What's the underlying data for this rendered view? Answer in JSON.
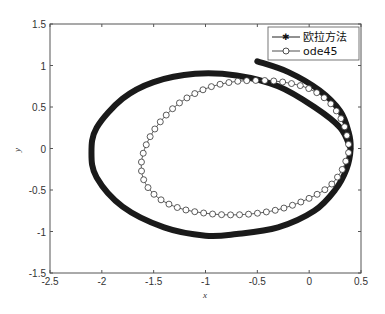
{
  "chart_data": {
    "type": "line",
    "title": "",
    "xlabel": "x",
    "ylabel": "y",
    "xlim": [
      -2.5,
      0.5
    ],
    "ylim": [
      -1.5,
      1.5
    ],
    "xticks": [
      "-2.5",
      "-2",
      "-1.5",
      "-1",
      "-0.5",
      "0",
      "0.5"
    ],
    "yticks": [
      "1.5",
      "1",
      "0.5",
      "0",
      "-0.5",
      "-1",
      "-1.5"
    ],
    "grid": false,
    "legend_position": "upper right",
    "legend": [
      "欧拉方法",
      "ode45"
    ],
    "series": [
      {
        "name": "欧拉方法",
        "marker": "*",
        "style": "thick dense starred line",
        "x": [
          -0.5,
          -0.2,
          0.1,
          0.3,
          0.38,
          0.4,
          0.36,
          0.25,
          0.05,
          -0.3,
          -0.7,
          -1.0,
          -1.4,
          -1.8,
          -2.05,
          -2.1,
          -2.05,
          -1.8,
          -1.5,
          -1.1,
          -0.7,
          -0.3,
          0.05,
          0.3,
          0.4
        ],
        "y": [
          1.05,
          0.92,
          0.7,
          0.45,
          0.2,
          0.0,
          -0.25,
          -0.5,
          -0.75,
          -0.95,
          -1.03,
          -1.05,
          -0.95,
          -0.7,
          -0.35,
          -0.05,
          0.25,
          0.6,
          0.8,
          0.9,
          0.88,
          0.75,
          0.5,
          0.25,
          0.0
        ]
      },
      {
        "name": "ode45",
        "marker": "o",
        "style": "thin line with circle markers",
        "x": [
          0.38,
          0.33,
          0.2,
          0.0,
          -0.25,
          -0.5,
          -0.75,
          -1.0,
          -1.25,
          -1.45,
          -1.57,
          -1.62,
          -1.58,
          -1.45,
          -1.25,
          -1.0,
          -0.75,
          -0.5,
          -0.25,
          0.0,
          0.2,
          0.32,
          0.38
        ],
        "y": [
          0.05,
          0.3,
          0.55,
          0.72,
          0.8,
          0.82,
          0.8,
          0.72,
          0.55,
          0.3,
          0.05,
          -0.2,
          -0.42,
          -0.6,
          -0.72,
          -0.78,
          -0.8,
          -0.78,
          -0.72,
          -0.6,
          -0.45,
          -0.25,
          -0.05
        ]
      }
    ]
  }
}
